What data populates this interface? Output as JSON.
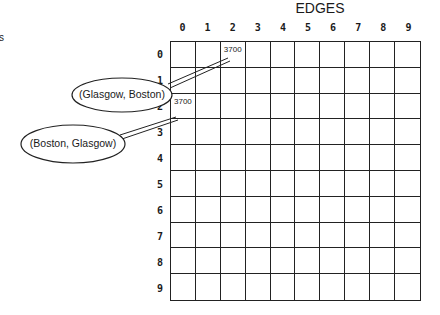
{
  "title": "EDGES",
  "cut_off_text": "s",
  "columns": [
    "0",
    "1",
    "2",
    "3",
    "4",
    "5",
    "6",
    "7",
    "8",
    "9"
  ],
  "rows": [
    "0",
    "1",
    "2",
    "3",
    "4",
    "5",
    "6",
    "7",
    "8",
    "9"
  ],
  "cells": [
    {
      "row": 0,
      "col": 2,
      "value": "3700"
    },
    {
      "row": 2,
      "col": 0,
      "value": "3700"
    }
  ],
  "callouts": [
    {
      "label": "(Glasgow, Boston)",
      "points_to": {
        "row": 0,
        "col": 2
      }
    },
    {
      "label": "(Boston, Glasgow)",
      "points_to": {
        "row": 2,
        "col": 0
      }
    }
  ]
}
